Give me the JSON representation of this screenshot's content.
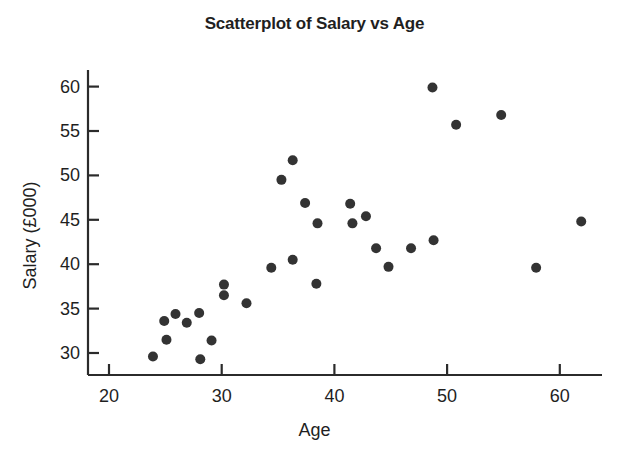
{
  "chart_data": {
    "type": "scatter",
    "title": "Scatterplot of Salary vs Age",
    "xlabel": "Age",
    "ylabel": "Salary (£000)",
    "xlim": [
      17.5,
      64.5
    ],
    "ylim": [
      28.0,
      61.5
    ],
    "xticks": [
      20,
      30,
      40,
      50,
      60
    ],
    "yticks": [
      30,
      35,
      40,
      45,
      50,
      55,
      60
    ],
    "xtick_labels": [
      "20",
      "30",
      "40",
      "50",
      "60"
    ],
    "ytick_labels": [
      "30",
      "35",
      "40",
      "45",
      "50",
      "55",
      "60"
    ],
    "grid": false,
    "legend": null,
    "marker": {
      "shape": "circle",
      "color": "#333333",
      "size": 5
    },
    "series": [
      {
        "name": "Employees",
        "x": [
          23.9,
          24.9,
          25.1,
          25.9,
          26.9,
          28.0,
          28.1,
          29.1,
          30.2,
          30.2,
          32.2,
          34.4,
          35.3,
          36.3,
          36.3,
          37.4,
          38.4,
          38.5,
          41.4,
          41.6,
          42.8,
          43.7,
          44.8,
          46.8,
          48.7,
          48.8,
          50.8,
          54.8,
          57.9,
          61.9
        ],
        "y": [
          29.6,
          33.6,
          31.5,
          34.4,
          33.4,
          34.5,
          29.3,
          31.4,
          37.7,
          36.5,
          35.6,
          39.6,
          49.5,
          51.7,
          40.5,
          46.9,
          37.8,
          44.6,
          46.8,
          44.6,
          45.4,
          41.8,
          39.7,
          41.8,
          59.9,
          42.7,
          55.7,
          56.8,
          39.6,
          44.8
        ]
      }
    ]
  },
  "axes_geometry": {
    "plot_left": 88,
    "plot_right": 600,
    "plot_top": 70,
    "plot_bottom": 375,
    "x_px_per_unit": 11.27,
    "y_px_per_unit": 8.88,
    "x_origin_px": 109,
    "x_origin_val": 20,
    "y_origin_px": 353,
    "y_origin_val": 30
  },
  "colors": {
    "background": "#ffffff",
    "axis": "#2b2b2b",
    "marker": "#333333",
    "text": "#1f1f1f"
  }
}
